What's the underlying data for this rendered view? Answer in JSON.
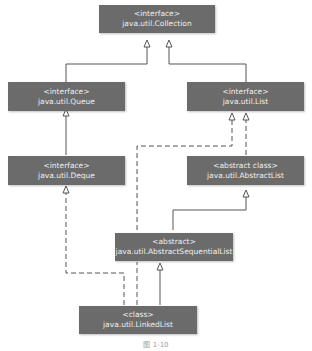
{
  "diagram": {
    "type": "uml-class-hierarchy",
    "nodes": [
      {
        "id": "collection",
        "stereotype": "<interface>",
        "name": "java.util.Collection"
      },
      {
        "id": "queue",
        "stereotype": "<interface>",
        "name": "java.util.Queue"
      },
      {
        "id": "list",
        "stereotype": "<interface>",
        "name": "java.util.List"
      },
      {
        "id": "deque",
        "stereotype": "<interface>",
        "name": "java.util.Deque"
      },
      {
        "id": "abstractlist",
        "stereotype": "<abstract class>",
        "name": "java.util.AbstractList"
      },
      {
        "id": "abstractsequentiallist",
        "stereotype": "<abstract>",
        "name": "java.util.AbstractSequentialList"
      },
      {
        "id": "linkedlist",
        "stereotype": "<class>",
        "name": "java.util.LinkedList"
      }
    ],
    "edges": [
      {
        "from": "queue",
        "to": "collection",
        "style": "solid"
      },
      {
        "from": "list",
        "to": "collection",
        "style": "solid"
      },
      {
        "from": "deque",
        "to": "queue",
        "style": "solid"
      },
      {
        "from": "abstractlist",
        "to": "list",
        "style": "dashed"
      },
      {
        "from": "abstractsequentiallist",
        "to": "list",
        "style": "dashed"
      },
      {
        "from": "abstractsequentiallist",
        "to": "abstractlist",
        "style": "solid"
      },
      {
        "from": "linkedlist",
        "to": "abstractsequentiallist",
        "style": "solid"
      },
      {
        "from": "linkedlist",
        "to": "deque",
        "style": "dashed"
      },
      {
        "from": "linkedlist",
        "to": "list",
        "style": "dashed"
      }
    ],
    "caption": "图 1-10"
  }
}
